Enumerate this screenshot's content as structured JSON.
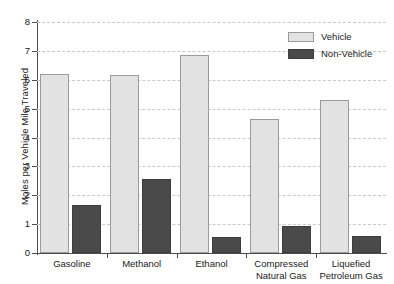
{
  "chart_data": {
    "type": "bar",
    "title": "",
    "xlabel": "",
    "ylabel": "Moles per Vehicle Mile Traveled",
    "ylim": [
      0,
      8
    ],
    "ytick_values": [
      0,
      1,
      2,
      3,
      4,
      5,
      6,
      7,
      8
    ],
    "ytick_labels": [
      "0",
      "1",
      "2",
      "3",
      "4",
      "5",
      "6",
      "7",
      "8"
    ],
    "grid": true,
    "grid_axis": "y",
    "legend_position": "top-right",
    "categories": [
      "Gasoline",
      "Methanol",
      "Ethanol",
      "Compressed Natural Gas",
      "Liquefied Petroleum Gas"
    ],
    "category_lines": [
      [
        "Gasoline"
      ],
      [
        "Methanol"
      ],
      [
        "Ethanol"
      ],
      [
        "Compressed",
        "Natural Gas"
      ],
      [
        "Liquefied",
        "Petroleum Gas"
      ]
    ],
    "series": [
      {
        "name": "Vehicle",
        "color": "#e2e2e2",
        "edge_color": "#9b9b9b",
        "values": [
          6.2,
          6.15,
          6.85,
          4.65,
          5.3
        ]
      },
      {
        "name": "Non-Vehicle",
        "color": "#4a4a4a",
        "edge_color": "#3d3d3d",
        "values": [
          1.65,
          2.55,
          0.55,
          0.95,
          0.6
        ]
      }
    ]
  },
  "legend": {
    "items": [
      {
        "label": "Vehicle",
        "swatch": "vehicle"
      },
      {
        "label": "Non-Vehicle",
        "swatch": "nonvehicle"
      }
    ]
  },
  "axes": {
    "y_title": "Moles per Vehicle Mile Traveled"
  }
}
